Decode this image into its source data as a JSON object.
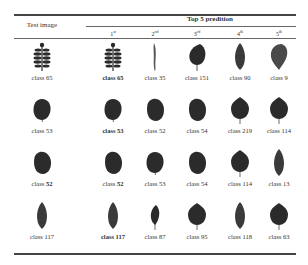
{
  "table": {
    "header": {
      "test_image": "Test image",
      "top5": "Top 5 predition",
      "ranks": [
        {
          "num": "1",
          "sup": "st"
        },
        {
          "num": "2",
          "sup": "nd"
        },
        {
          "num": "3",
          "sup": "rd"
        },
        {
          "num": "4",
          "sup": "th"
        },
        {
          "num": "5",
          "sup": "th"
        }
      ]
    },
    "rows": [
      {
        "test": {
          "prefix": "class ",
          "num": "65",
          "bold": false,
          "shape": "compound"
        },
        "preds": [
          {
            "prefix": "class ",
            "num": "65",
            "bold_all": true,
            "shape": "compound"
          },
          {
            "prefix": "class ",
            "num": "35",
            "shape": "needle"
          },
          {
            "prefix": "class ",
            "num": "151",
            "shape": "round-point"
          },
          {
            "prefix": "class ",
            "num": "90",
            "shape": "lance"
          },
          {
            "prefix": "class ",
            "num": "9",
            "shape": "obovate"
          }
        ]
      },
      {
        "test": {
          "prefix": "class ",
          "num": "53",
          "bold": false,
          "shape": "round"
        },
        "preds": [
          {
            "prefix": "class ",
            "num": "53",
            "bold_all": true,
            "shape": "round"
          },
          {
            "prefix": "class ",
            "num": "52",
            "shape": "oval"
          },
          {
            "prefix": "class ",
            "num": "54",
            "shape": "oval"
          },
          {
            "prefix": "class ",
            "num": "219",
            "shape": "round-tip"
          },
          {
            "prefix": "class ",
            "num": "114",
            "shape": "round-tip"
          }
        ]
      },
      {
        "test": {
          "prefix": "class ",
          "num": "52",
          "bold_num": true,
          "shape": "oval"
        },
        "preds": [
          {
            "prefix": "class ",
            "num": "52",
            "bold_num": true,
            "shape": "oval"
          },
          {
            "prefix": "class ",
            "num": "53",
            "shape": "round"
          },
          {
            "prefix": "class ",
            "num": "54",
            "shape": "oval"
          },
          {
            "prefix": "class ",
            "num": "114",
            "shape": "round-tip"
          },
          {
            "prefix": "class ",
            "num": "13",
            "shape": "lance"
          }
        ]
      },
      {
        "test": {
          "prefix": "class ",
          "num": "117",
          "bold": false,
          "shape": "lance"
        },
        "preds": [
          {
            "prefix": "class ",
            "num": "117",
            "bold_all": true,
            "shape": "lance"
          },
          {
            "prefix": "class ",
            "num": "87",
            "shape": "lance-small"
          },
          {
            "prefix": "class ",
            "num": "95",
            "shape": "round-point"
          },
          {
            "prefix": "class ",
            "num": "118",
            "shape": "lance"
          },
          {
            "prefix": "class ",
            "num": "63",
            "shape": "round-tip"
          }
        ]
      }
    ]
  },
  "colors": {
    "leaf_dark": "#2b2b2b",
    "leaf_mid": "#4a4a4a",
    "rule": "#444444"
  }
}
